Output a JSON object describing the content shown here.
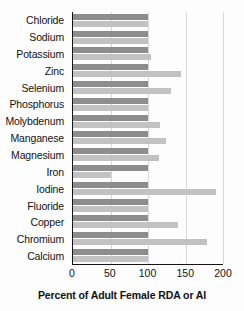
{
  "chart_data": {
    "type": "bar",
    "title": "",
    "xlabel": "Percent of Adult Female RDA or AI",
    "ylabel": "",
    "orientation": "horizontal",
    "xlim": [
      0,
      200
    ],
    "xticks": [
      0,
      50,
      100,
      150,
      200
    ],
    "xtick_labels": [
      "0",
      "50",
      "100",
      "150",
      "200"
    ],
    "grid": true,
    "legend_position": "none",
    "categories": [
      "Chloride",
      "Sodium",
      "Potassium",
      "Zinc",
      "Selenium",
      "Phosphorus",
      "Molybdenum",
      "Manganese",
      "Magnesium",
      "Iron",
      "Iodine",
      "Fluoride",
      "Copper",
      "Chromium",
      "Calcium"
    ],
    "series": [
      {
        "name": "Reference (RDA or AI)",
        "color": "#8d8d8d",
        "values": [
          100,
          100,
          100,
          100,
          100,
          100,
          100,
          100,
          100,
          100,
          100,
          100,
          100,
          100,
          100
        ]
      },
      {
        "name": "Actual intake",
        "color": "#c2c2c2",
        "values": [
          100,
          100,
          104,
          144,
          130,
          100,
          116,
          124,
          114,
          50,
          190,
          100,
          140,
          178,
          100
        ]
      }
    ]
  },
  "axis": {
    "tick_0": "0",
    "tick_1": "50",
    "tick_2": "100",
    "tick_3": "150",
    "tick_4": "200"
  },
  "labels": {
    "chloride": "Chloride",
    "sodium": "Sodium",
    "potassium": "Potassium",
    "zinc": "Zinc",
    "selenium": "Selenium",
    "phosphorus": "Phosphorus",
    "molybdenum": "Molybdenum",
    "manganese": "Manganese",
    "magnesium": "Magnesium",
    "iron": "Iron",
    "iodine": "Iodine",
    "fluoride": "Fluoride",
    "copper": "Copper",
    "chromium": "Chromium",
    "calcium": "Calcium"
  },
  "axis_title": "Percent of Adult Female RDA or AI"
}
